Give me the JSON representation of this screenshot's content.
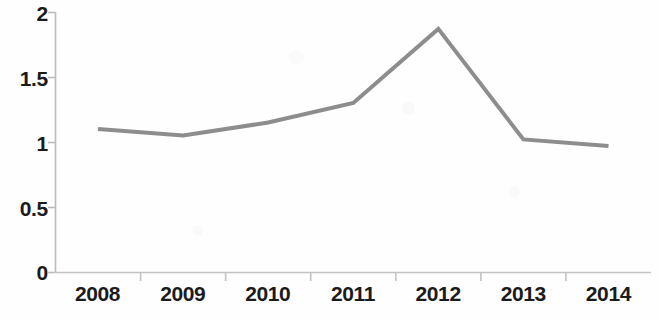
{
  "chart_data": {
    "type": "line",
    "title": "",
    "subtitle": "",
    "xlabel": "",
    "ylabel": "",
    "categories": [
      "2008",
      "2009",
      "2010",
      "2011",
      "2012",
      "2013",
      "2014"
    ],
    "values": [
      1.1,
      1.05,
      1.15,
      1.3,
      1.87,
      1.02,
      0.97
    ],
    "series": [
      {
        "name": "",
        "values": [
          1.1,
          1.05,
          1.15,
          1.3,
          1.87,
          1.02,
          0.97
        ]
      }
    ],
    "y_ticks": [
      "0",
      "0.5",
      "1",
      "1.5",
      "2"
    ],
    "y_tick_values": [
      0,
      0.5,
      1,
      1.5,
      2
    ],
    "ylim": [
      0,
      2
    ],
    "grid": false,
    "legend": false,
    "legend_position": "none",
    "markers": false,
    "annotations": [],
    "colors": {
      "line": "#8d8d8d",
      "axis": "#bcbcbc",
      "tick_label": "#1b1b1b",
      "background": "#fefefe"
    },
    "line_width": 4
  },
  "axes": {
    "y_axis_name": "value-axis",
    "x_axis_name": "year-axis"
  }
}
